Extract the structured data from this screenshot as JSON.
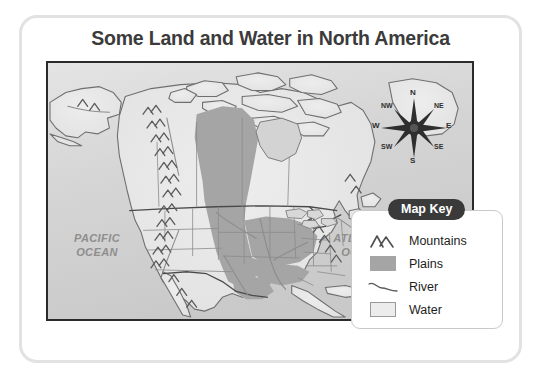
{
  "page": {
    "title": "Some Land and Water in North America"
  },
  "map": {
    "ocean_labels": [
      {
        "name": "pacific",
        "line1": "PACIFIC",
        "line2": "OCEAN"
      },
      {
        "name": "atlantic",
        "line1": "ATLANTIC",
        "line2": "OCEAN"
      }
    ],
    "compass": {
      "name": "compass-rose",
      "directions": {
        "n": "N",
        "ne": "NE",
        "e": "E",
        "se": "SE",
        "s": "S",
        "sw": "SW",
        "w": "W",
        "nw": "NW"
      }
    }
  },
  "map_key": {
    "heading": "Map Key",
    "items": [
      {
        "symbol": "mountains-symbol",
        "label": "Mountains"
      },
      {
        "symbol": "plains-swatch",
        "label": "Plains"
      },
      {
        "symbol": "river-symbol",
        "label": "River"
      },
      {
        "symbol": "water-swatch",
        "label": "Water"
      }
    ]
  },
  "colors": {
    "title_text": "#3b3b3b",
    "map_border": "#2b2b2b",
    "ocean_fill": "#d6d6d6",
    "land_fill": "#e8e8e8",
    "plains_fill": "#a5a5a5",
    "water_swatch": "#ececec",
    "key_badge_bg": "#3a3a3a",
    "ocean_label_text": "#8e8e8e",
    "card_border": "#e2e2e2"
  }
}
